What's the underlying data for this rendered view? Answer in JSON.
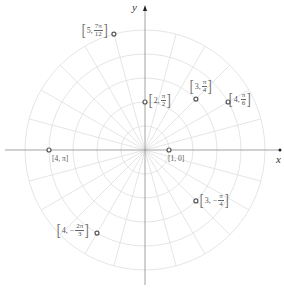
{
  "diagram": {
    "type": "polar-grid-points",
    "axes": {
      "x_label": "x",
      "y_label": "y"
    },
    "grid": {
      "rings": 5,
      "ring_spacing_units": 1,
      "spoke_step": "π/12"
    },
    "colors": {
      "grid": "#e2e2e2",
      "axis": "#888888",
      "point": "#555555",
      "text": "#555555"
    }
  },
  "chart_data": {
    "type": "scatter",
    "title": "",
    "coordinate_system": "polar",
    "xlabel": "x",
    "ylabel": "y",
    "points": [
      {
        "r": 5,
        "theta": "7π/12",
        "label": {
          "r": "5",
          "num": "7π",
          "den": "12"
        }
      },
      {
        "r": 2,
        "theta": "π/2",
        "label": {
          "r": "2",
          "num": "π",
          "den": "2"
        }
      },
      {
        "r": 3,
        "theta": "π/4",
        "label": {
          "r": "3",
          "num": "π",
          "den": "4"
        }
      },
      {
        "r": 4,
        "theta": "π/6",
        "label": {
          "r": "4",
          "num": "π",
          "den": "6"
        }
      },
      {
        "r": 4,
        "theta": "π",
        "label": {
          "text": "[4, π]"
        }
      },
      {
        "r": 1,
        "theta": "0",
        "label": {
          "text": "[1, 0]"
        }
      },
      {
        "r": 3,
        "theta": "-π/4",
        "label": {
          "r": "3",
          "num": "π",
          "den": "4",
          "neg": true
        }
      },
      {
        "r": 4,
        "theta": "-2π/3",
        "label": {
          "r": "4",
          "num": "2π",
          "den": "3",
          "neg": true
        }
      }
    ],
    "grid": true,
    "rlim": [
      0,
      5
    ]
  },
  "labels": {
    "p0_r": "5,",
    "p0_num": "7π",
    "p0_den": "12",
    "p1_r": "2,",
    "p1_num": "π",
    "p1_den": "2",
    "p2_r": "3,",
    "p2_num": "π",
    "p2_den": "4",
    "p3_r": "4,",
    "p3_num": "π",
    "p3_den": "6",
    "p4_text": "[4, π]",
    "p5_text": "[1, 0]",
    "p6_r": "3, −",
    "p6_num": "π",
    "p6_den": "4",
    "p7_r": "4, −",
    "p7_num": "2π",
    "p7_den": "3",
    "open": "[",
    "close": "]"
  }
}
